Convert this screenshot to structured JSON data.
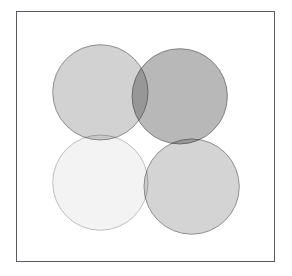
{
  "figure": {
    "background_color": "#ffffff",
    "width": 292,
    "height": 276,
    "frame": {
      "border_color": "#5a5a62",
      "border_width": 1,
      "fill_color": "#ffffff",
      "x": 16,
      "y": 11,
      "width": 259,
      "height": 251
    }
  },
  "chart_data": {
    "type": "venn",
    "title": "",
    "subtitle": "",
    "xlabel": "",
    "ylabel": "",
    "grid": false,
    "legend": "none",
    "axis_visible": false,
    "tick_labels": [],
    "annotations": [],
    "set_count": 4,
    "layout": "2x2-grid-overlapping-circles",
    "radius": 48,
    "sets": [
      {
        "name": "set-top-left",
        "label": "",
        "cx": 100,
        "cy": 92,
        "r": 48,
        "fill": "#b6b6b6",
        "opacity": 0.62,
        "stroke": "#8c8c8c",
        "stroke_width": 1
      },
      {
        "name": "set-top-right",
        "label": "",
        "cx": 180,
        "cy": 96,
        "r": 48,
        "fill": "#9a9a9a",
        "opacity": 0.7,
        "stroke": "#7e7e7e",
        "stroke_width": 1
      },
      {
        "name": "set-bottom-left",
        "label": "",
        "cx": 100,
        "cy": 183,
        "r": 48,
        "fill": "#efefef",
        "opacity": 0.75,
        "stroke": "#bdbdbd",
        "stroke_width": 1
      },
      {
        "name": "set-bottom-right",
        "label": "",
        "cx": 192,
        "cy": 187,
        "r": 48,
        "fill": "#bdbdbd",
        "opacity": 0.65,
        "stroke": "#8f8f8f",
        "stroke_width": 1
      }
    ]
  }
}
